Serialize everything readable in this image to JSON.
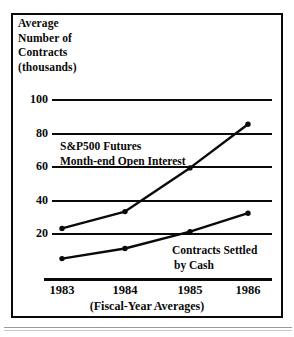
{
  "figure": {
    "title_lines": [
      "Average",
      "Number of",
      "Contracts",
      "(thousands)"
    ],
    "x_subtitle": "(Fiscal-Year Averages)",
    "frame_color": "#0a0a0a",
    "background_color": "#ffffff"
  },
  "annotations": {
    "upper": {
      "line1": "S&P500 Futures",
      "line2": "Month-end Open Interest"
    },
    "lower": {
      "line1": "Contracts Settled",
      "line2": "by Cash"
    }
  },
  "chart_data": {
    "type": "line",
    "title": "Average Number of Contracts (thousands)",
    "xlabel": "(Fiscal-Year Averages)",
    "ylabel": "Average Number of Contracts (thousands)",
    "categories": [
      "1983",
      "1984",
      "1985",
      "1986"
    ],
    "x": [
      1983,
      1984,
      1985,
      1986
    ],
    "ylim": [
      0,
      100
    ],
    "yticks": [
      20,
      40,
      60,
      80,
      100
    ],
    "ytick_labels": [
      "20",
      "40",
      "60",
      "80",
      "100"
    ],
    "grid": true,
    "legend": "inline-annotations",
    "series": [
      {
        "name": "S&P500 Futures Month-end Open Interest",
        "values": [
          23,
          33,
          59,
          85
        ],
        "marker": "dot",
        "color": "#0a0a0a"
      },
      {
        "name": "Contracts Settled by Cash",
        "values": [
          5,
          11,
          21,
          32
        ],
        "marker": "dot",
        "color": "#0a0a0a"
      }
    ]
  }
}
